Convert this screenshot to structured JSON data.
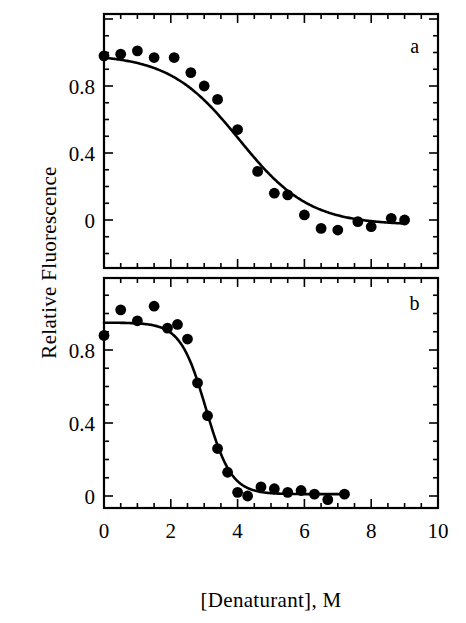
{
  "figure": {
    "axis_label_y": "Relative Fluorescence",
    "axis_label_x": "[Denaturant], M",
    "ink_color": "#000000",
    "background_color": "#ffffff"
  },
  "axes": {
    "x_ticks_major": [
      "0",
      "2",
      "4",
      "6",
      "8",
      "10"
    ],
    "y_ticks_major": [
      "0",
      "0.4",
      "0.8"
    ]
  },
  "panels": {
    "a": {
      "label": "a"
    },
    "b": {
      "label": "b"
    }
  },
  "chart_data": [
    {
      "type": "scatter",
      "panel": "a",
      "title": "",
      "subtitle": "",
      "xlabel": "[Denaturant], M",
      "ylabel": "Relative Fluorescence",
      "xlim": [
        0,
        10
      ],
      "ylim": [
        -0.16,
        1.12
      ],
      "xticks": [
        0,
        2,
        4,
        6,
        8,
        10
      ],
      "xticks_minor_step": 0.5,
      "yticks": [
        0,
        0.4,
        0.8
      ],
      "yticks_minor_step": 0.1,
      "grid": false,
      "legend": "none",
      "annotations": [
        {
          "text": "a",
          "x": 9.3,
          "y": 1.0
        }
      ],
      "series": [
        {
          "name": "Relative fluorescence (sample a)",
          "marker": "filled-circle",
          "points": [
            {
              "x": 0.0,
              "y": 0.98
            },
            {
              "x": 0.5,
              "y": 0.99
            },
            {
              "x": 1.0,
              "y": 1.01
            },
            {
              "x": 1.5,
              "y": 0.97
            },
            {
              "x": 2.1,
              "y": 0.97
            },
            {
              "x": 2.6,
              "y": 0.88
            },
            {
              "x": 3.0,
              "y": 0.8
            },
            {
              "x": 3.4,
              "y": 0.72
            },
            {
              "x": 4.0,
              "y": 0.54
            },
            {
              "x": 4.6,
              "y": 0.29
            },
            {
              "x": 5.1,
              "y": 0.16
            },
            {
              "x": 5.5,
              "y": 0.15
            },
            {
              "x": 6.0,
              "y": 0.03
            },
            {
              "x": 6.5,
              "y": -0.05
            },
            {
              "x": 7.0,
              "y": -0.06
            },
            {
              "x": 7.6,
              "y": -0.01
            },
            {
              "x": 8.0,
              "y": -0.04
            },
            {
              "x": 8.6,
              "y": 0.01
            },
            {
              "x": 9.0,
              "y": 0.0
            }
          ]
        },
        {
          "name": "Two-state fit (sample a)",
          "type": "line",
          "fit": "sigmoid",
          "midpoint": 4.05,
          "slope": 1.05,
          "top": 0.99,
          "bottom": -0.03
        }
      ]
    },
    {
      "type": "scatter",
      "panel": "b",
      "title": "",
      "subtitle": "",
      "xlabel": "[Denaturant], M",
      "ylabel": "Relative Fluorescence",
      "xlim": [
        0,
        10
      ],
      "ylim": [
        -0.12,
        1.16
      ],
      "xticks": [
        0,
        2,
        4,
        6,
        8,
        10
      ],
      "xticks_minor_step": 0.5,
      "yticks": [
        0,
        0.4,
        0.8
      ],
      "yticks_minor_step": 0.1,
      "grid": false,
      "legend": "none",
      "annotations": [
        {
          "text": "b",
          "x": 9.3,
          "y": 1.02
        }
      ],
      "series": [
        {
          "name": "Relative fluorescence (sample b)",
          "marker": "filled-circle",
          "points": [
            {
              "x": 0.0,
              "y": 0.88
            },
            {
              "x": 0.5,
              "y": 1.02
            },
            {
              "x": 1.0,
              "y": 0.96
            },
            {
              "x": 1.5,
              "y": 1.04
            },
            {
              "x": 1.9,
              "y": 0.92
            },
            {
              "x": 2.2,
              "y": 0.94
            },
            {
              "x": 2.5,
              "y": 0.86
            },
            {
              "x": 2.8,
              "y": 0.62
            },
            {
              "x": 3.1,
              "y": 0.44
            },
            {
              "x": 3.4,
              "y": 0.26
            },
            {
              "x": 3.7,
              "y": 0.13
            },
            {
              "x": 4.0,
              "y": 0.02
            },
            {
              "x": 4.3,
              "y": 0.0
            },
            {
              "x": 4.7,
              "y": 0.05
            },
            {
              "x": 5.1,
              "y": 0.04
            },
            {
              "x": 5.5,
              "y": 0.02
            },
            {
              "x": 5.9,
              "y": 0.03
            },
            {
              "x": 6.3,
              "y": 0.01
            },
            {
              "x": 6.7,
              "y": -0.02
            },
            {
              "x": 7.2,
              "y": 0.01
            }
          ]
        },
        {
          "name": "Two-state fit (sample b)",
          "type": "line",
          "fit": "sigmoid",
          "midpoint": 3.05,
          "slope": 0.38,
          "top": 0.95,
          "bottom": 0.01
        }
      ]
    }
  ]
}
